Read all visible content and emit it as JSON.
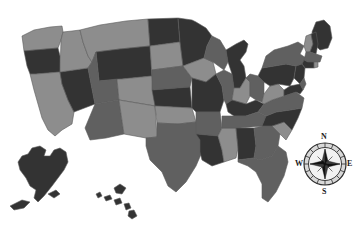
{
  "map": {
    "title": "United States choropleth map",
    "background_color": "#ffffff",
    "border_color": "#5a5a5a",
    "palette": {
      "light": "#8d8d8d",
      "medium": "#606060",
      "dark": "#333333",
      "darkest": "#2b2b2b"
    },
    "insets": [
      {
        "name": "alaska",
        "shade": "dark"
      },
      {
        "name": "hawaii",
        "shade": "dark"
      }
    ],
    "states": [
      {
        "code": "WA",
        "name": "Washington",
        "shade": "light"
      },
      {
        "code": "OR",
        "name": "Oregon",
        "shade": "dark"
      },
      {
        "code": "CA",
        "name": "California",
        "shade": "light"
      },
      {
        "code": "NV",
        "name": "Nevada",
        "shade": "dark"
      },
      {
        "code": "ID",
        "name": "Idaho",
        "shade": "light"
      },
      {
        "code": "MT",
        "name": "Montana",
        "shade": "light"
      },
      {
        "code": "WY",
        "name": "Wyoming",
        "shade": "dark"
      },
      {
        "code": "UT",
        "name": "Utah",
        "shade": "medium"
      },
      {
        "code": "AZ",
        "name": "Arizona",
        "shade": "medium"
      },
      {
        "code": "CO",
        "name": "Colorado",
        "shade": "light"
      },
      {
        "code": "NM",
        "name": "New Mexico",
        "shade": "light"
      },
      {
        "code": "ND",
        "name": "North Dakota",
        "shade": "dark"
      },
      {
        "code": "SD",
        "name": "South Dakota",
        "shade": "light"
      },
      {
        "code": "NE",
        "name": "Nebraska",
        "shade": "medium"
      },
      {
        "code": "KS",
        "name": "Kansas",
        "shade": "dark"
      },
      {
        "code": "OK",
        "name": "Oklahoma",
        "shade": "light"
      },
      {
        "code": "TX",
        "name": "Texas",
        "shade": "medium"
      },
      {
        "code": "MN",
        "name": "Minnesota",
        "shade": "dark"
      },
      {
        "code": "IA",
        "name": "Iowa",
        "shade": "light"
      },
      {
        "code": "MO",
        "name": "Missouri",
        "shade": "dark"
      },
      {
        "code": "AR",
        "name": "Arkansas",
        "shade": "medium"
      },
      {
        "code": "LA",
        "name": "Louisiana",
        "shade": "dark"
      },
      {
        "code": "WI",
        "name": "Wisconsin",
        "shade": "medium"
      },
      {
        "code": "IL",
        "name": "Illinois",
        "shade": "medium"
      },
      {
        "code": "MS",
        "name": "Mississippi",
        "shade": "light"
      },
      {
        "code": "MI",
        "name": "Michigan",
        "shade": "dark"
      },
      {
        "code": "IN",
        "name": "Indiana",
        "shade": "light"
      },
      {
        "code": "KY",
        "name": "Kentucky",
        "shade": "dark"
      },
      {
        "code": "TN",
        "name": "Tennessee",
        "shade": "medium"
      },
      {
        "code": "AL",
        "name": "Alabama",
        "shade": "dark"
      },
      {
        "code": "OH",
        "name": "Ohio",
        "shade": "medium"
      },
      {
        "code": "GA",
        "name": "Georgia",
        "shade": "medium"
      },
      {
        "code": "FL",
        "name": "Florida",
        "shade": "medium"
      },
      {
        "code": "SC",
        "name": "South Carolina",
        "shade": "light"
      },
      {
        "code": "NC",
        "name": "North Carolina",
        "shade": "dark"
      },
      {
        "code": "VA",
        "name": "Virginia",
        "shade": "medium"
      },
      {
        "code": "WV",
        "name": "West Virginia",
        "shade": "light"
      },
      {
        "code": "PA",
        "name": "Pennsylvania",
        "shade": "dark"
      },
      {
        "code": "NY",
        "name": "New York",
        "shade": "medium"
      },
      {
        "code": "ME",
        "name": "Maine",
        "shade": "dark"
      },
      {
        "code": "VT",
        "name": "Vermont",
        "shade": "light"
      },
      {
        "code": "NH",
        "name": "New Hampshire",
        "shade": "dark"
      },
      {
        "code": "MA",
        "name": "Massachusetts",
        "shade": "medium"
      },
      {
        "code": "CT",
        "name": "Connecticut",
        "shade": "dark"
      },
      {
        "code": "RI",
        "name": "Rhode Island",
        "shade": "light"
      },
      {
        "code": "NJ",
        "name": "New Jersey",
        "shade": "dark"
      },
      {
        "code": "DE",
        "name": "Delaware",
        "shade": "medium"
      },
      {
        "code": "MD",
        "name": "Maryland",
        "shade": "dark"
      }
    ]
  },
  "compass": {
    "name": "compass-rose",
    "north": "N",
    "west": "W",
    "east": "E",
    "south": "S"
  }
}
